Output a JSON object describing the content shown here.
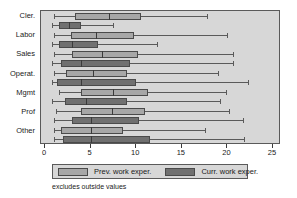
{
  "chart_data": {
    "type": "box",
    "title": "",
    "xlabel": "",
    "ylabel": "",
    "xlim": [
      0,
      25
    ],
    "xticks": [
      0,
      5,
      10,
      15,
      20,
      25
    ],
    "xtick_labels": [
      "0",
      "5",
      "10",
      "15",
      "20",
      "25"
    ],
    "grid": false,
    "legend_position": "bottom",
    "categories": [
      "Cler.",
      "Labor",
      "Sales",
      "Operat.",
      "Mgmt",
      "Prof",
      "Other"
    ],
    "series": [
      {
        "name": "Prev. work exper.",
        "color": "#a7a7a7",
        "boxes": [
          {
            "category": "Cler.",
            "whisker_low": 1.0,
            "q1": 3.3,
            "median": 7.0,
            "q3": 10.5,
            "whisker_high": 17.8
          },
          {
            "category": "Labor",
            "whisker_low": 1.0,
            "q1": 2.8,
            "median": 5.6,
            "q3": 9.8,
            "whisker_high": 20.0
          },
          {
            "category": "Sales",
            "whisker_low": 1.0,
            "q1": 3.0,
            "median": 6.2,
            "q3": 10.2,
            "whisker_high": 20.6
          },
          {
            "category": "Operat.",
            "whisker_low": 1.0,
            "q1": 2.3,
            "median": 5.3,
            "q3": 9.0,
            "whisker_high": 19.0
          },
          {
            "category": "Mgmt",
            "whisker_low": 1.5,
            "q1": 4.0,
            "median": 7.5,
            "q3": 11.3,
            "whisker_high": 19.8
          },
          {
            "category": "Prof",
            "whisker_low": 1.2,
            "q1": 3.9,
            "median": 7.3,
            "q3": 11.0,
            "whisker_high": 20.2
          },
          {
            "category": "Other",
            "whisker_low": 1.0,
            "q1": 1.8,
            "median": 5.0,
            "q3": 8.5,
            "whisker_high": 17.5
          }
        ]
      },
      {
        "name": "Curr. work exper.",
        "color": "#707070",
        "boxes": [
          {
            "category": "Cler.",
            "whisker_low": 0.8,
            "q1": 1.5,
            "median": 2.6,
            "q3": 4.0,
            "whisker_high": 7.5
          },
          {
            "category": "Labor",
            "whisker_low": 0.8,
            "q1": 1.5,
            "median": 3.0,
            "q3": 5.8,
            "whisker_high": 12.3
          },
          {
            "category": "Sales",
            "whisker_low": 0.8,
            "q1": 1.8,
            "median": 4.0,
            "q3": 9.3,
            "whisker_high": 20.6
          },
          {
            "category": "Operat.",
            "whisker_low": 0.8,
            "q1": 1.3,
            "median": 4.0,
            "q3": 10.0,
            "whisker_high": 22.3
          },
          {
            "category": "Mgmt",
            "whisker_low": 0.8,
            "q1": 2.2,
            "median": 4.5,
            "q3": 9.0,
            "whisker_high": 19.2
          },
          {
            "category": "Prof",
            "whisker_low": 1.0,
            "q1": 3.0,
            "median": 5.0,
            "q3": 10.3,
            "whisker_high": 21.7
          },
          {
            "category": "Other",
            "whisker_low": 1.0,
            "q1": 2.0,
            "median": 5.0,
            "q3": 11.5,
            "whisker_high": 21.8
          }
        ]
      }
    ]
  },
  "legend": {
    "entries": [
      {
        "label": "Prev. work exper."
      },
      {
        "label": "Curr. work exper."
      }
    ]
  },
  "footnote": "excludes outside values",
  "colors": {
    "prev": "#a7a7a7",
    "curr": "#707070",
    "plot_background": "#d7d7d7",
    "frame": "#5a5a5a",
    "page_background": "#ffffff"
  }
}
